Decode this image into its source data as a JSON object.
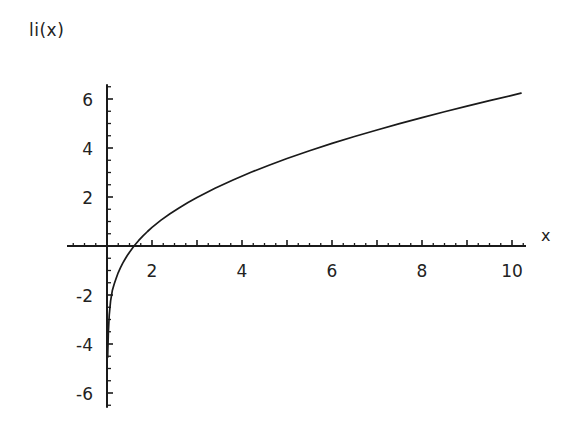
{
  "chart_data": {
    "type": "line",
    "title": "li(x)",
    "xlabel": "x",
    "ylabel": "li(x)",
    "xlim": [
      0.85,
      10.45
    ],
    "ylim": [
      -6.6,
      6.6
    ],
    "grid": false,
    "legend": null,
    "x_ticks": [
      2,
      4,
      6,
      8,
      10
    ],
    "x_tick_labels": [
      "2",
      "4",
      "6",
      "8",
      "10"
    ],
    "x_minor_tick_step": 0.25,
    "y_ticks": [
      6,
      4,
      2,
      -2,
      -4,
      -6
    ],
    "y_tick_labels": [
      "6",
      "4",
      "2",
      "-2",
      "-4",
      "-6"
    ],
    "y_minor_tick_step": 0.5,
    "x_axis_position_y": 0,
    "y_axis_position_x": 1,
    "asymptote_x": 1,
    "zero_crossing_x": 1.45,
    "series": [
      {
        "name": "li(x)",
        "color": "#1a1a1a",
        "x": [
          1.015,
          1.02,
          1.03,
          1.05,
          1.08,
          1.12,
          1.16,
          1.2,
          1.25,
          1.3,
          1.35,
          1.4,
          1.45,
          1.5,
          1.6,
          1.7,
          1.8,
          1.9,
          2.0,
          2.2,
          2.4,
          2.6,
          2.8,
          3.0,
          3.4,
          3.8,
          4.2,
          4.6,
          5.0,
          5.5,
          6.0,
          6.5,
          7.0,
          7.5,
          8.0,
          8.5,
          9.0,
          9.5,
          10.0,
          10.2
        ],
        "y": [
          -6.3,
          -5.8,
          -4.9,
          -3.9,
          -3.1,
          -2.5,
          -2.15,
          -1.85,
          -1.5,
          -1.22,
          -0.97,
          -0.75,
          -0.54,
          -0.35,
          0.0,
          0.3,
          0.57,
          0.82,
          1.05,
          1.46,
          1.82,
          2.15,
          2.46,
          2.74,
          3.26,
          3.73,
          4.17,
          4.57,
          4.95,
          5.39,
          5.8,
          6.19,
          6.56,
          6.92,
          7.26,
          7.59,
          7.91,
          8.22,
          8.52,
          8.64
        ],
        "y_plotted_note": "curve rendered in axis units from -6.3 at x~1.015 rising to ~6.15 at x~10.2"
      }
    ]
  },
  "figure": {
    "background": "#ffffff",
    "axis_color": "#1a1a1a",
    "curve_color": "#1a1a1a"
  }
}
